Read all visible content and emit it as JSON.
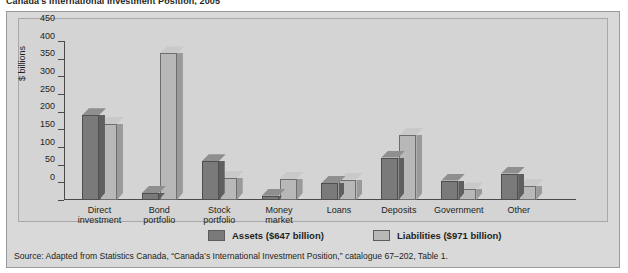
{
  "figure": {
    "title": "Canada's International Investment Position, 2005",
    "panel_bg": "#d9d9d9",
    "plot_bg": "#d4d4d4"
  },
  "legend": {
    "position": "bottom-center",
    "items": [
      {
        "label": "Assets ($647 billion)",
        "color": "#7a7a7a"
      },
      {
        "label": "Liabilities ($971 billion)",
        "color": "#b8b8b8"
      }
    ]
  },
  "source": {
    "text": "Source: Adapted from Statistics Canada, “Canada’s International Investment Position,” catalogue 67–202, Table 1."
  },
  "chart_data": {
    "type": "bar",
    "title": "Canada's International Investment Position, 2005",
    "xlabel": "",
    "ylabel": "$ billions",
    "ylim": [
      0,
      450
    ],
    "yticks": [
      0,
      50,
      100,
      150,
      200,
      250,
      300,
      350,
      400,
      450
    ],
    "ytick_labels": [
      "0",
      "50",
      "100",
      "150",
      "200",
      "250",
      "300",
      "350",
      "400",
      "450"
    ],
    "grid": false,
    "style": "3d-grouped-columns",
    "categories": [
      "Direct\ninvestment",
      "Bond\nportfolio",
      "Stock\nportfolio",
      "Money\nmarket",
      "Loans",
      "Deposits",
      "Government",
      "Other"
    ],
    "category_labels": [
      [
        "Direct",
        "investment"
      ],
      [
        "Bond",
        "portfolio"
      ],
      [
        "Stock",
        "portfolio"
      ],
      [
        "Money",
        "market"
      ],
      [
        "Loans",
        ""
      ],
      [
        "Deposits",
        ""
      ],
      [
        "Government",
        ""
      ],
      [
        "Other",
        ""
      ]
    ],
    "series": [
      {
        "name": "Assets ($647 billion)",
        "color": "#7a7a7a",
        "total": 647,
        "values": [
          240,
          20,
          110,
          12,
          48,
          120,
          55,
          75
        ]
      },
      {
        "name": "Liabilities ($971 billion)",
        "color": "#b8b8b8",
        "total": 971,
        "values": [
          215,
          415,
          62,
          60,
          58,
          185,
          30,
          40
        ]
      }
    ]
  }
}
